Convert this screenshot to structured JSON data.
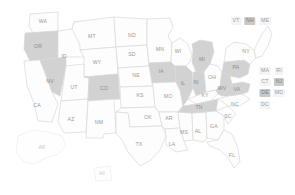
{
  "map": {
    "title": "United States choropleth state map",
    "colors": {
      "selected_fill": "#d2d2d2",
      "unselected_fill": "#fdfdfd",
      "border": "#d8d8d8",
      "label": "#9a9a9a",
      "badge_background": "#f4f4f4",
      "badge_selected_background": "#c9c9c9",
      "page_background": "#ffffff"
    },
    "selected_states": [
      "OR",
      "NV",
      "CO",
      "IA",
      "IL",
      "IN",
      "MI",
      "PA",
      "WV",
      "VA",
      "TN",
      "NH",
      "NJ",
      "DE"
    ],
    "states": [
      {
        "code": "WA",
        "label": "WA",
        "selected": false,
        "lx": 43,
        "ly": 22
      },
      {
        "code": "OR",
        "label": "OR",
        "selected": true,
        "lx": 38,
        "ly": 47
      },
      {
        "code": "CA",
        "label": "CA",
        "selected": false,
        "lx": 37,
        "ly": 106
      },
      {
        "code": "NV",
        "label": "NV",
        "selected": true,
        "lx": 50,
        "ly": 82
      },
      {
        "code": "ID",
        "label": "ID",
        "selected": false,
        "lx": 64,
        "ly": 57
      },
      {
        "code": "MT",
        "label": "MT",
        "selected": false,
        "lx": 92,
        "ly": 37
      },
      {
        "code": "WY",
        "label": "WY",
        "selected": false,
        "lx": 97,
        "ly": 63
      },
      {
        "code": "UT",
        "label": "UT",
        "selected": false,
        "lx": 74,
        "ly": 88
      },
      {
        "code": "AZ",
        "label": "AZ",
        "selected": false,
        "lx": 71,
        "ly": 120
      },
      {
        "code": "CO",
        "label": "CO",
        "selected": true,
        "lx": 104,
        "ly": 89
      },
      {
        "code": "NM",
        "label": "NM",
        "selected": false,
        "lx": 99,
        "ly": 123
      },
      {
        "code": "ND",
        "label": "ND",
        "selected": false,
        "lx": 132,
        "ly": 36
      },
      {
        "code": "SD",
        "label": "SD",
        "selected": false,
        "lx": 132,
        "ly": 55
      },
      {
        "code": "NE",
        "label": "NE",
        "selected": false,
        "lx": 136,
        "ly": 76
      },
      {
        "code": "KS",
        "label": "KS",
        "selected": false,
        "lx": 140,
        "ly": 96
      },
      {
        "code": "OK",
        "label": "OK",
        "selected": false,
        "lx": 148,
        "ly": 118
      },
      {
        "code": "TX",
        "label": "TX",
        "selected": false,
        "lx": 139,
        "ly": 145
      },
      {
        "code": "MN",
        "label": "MN",
        "selected": false,
        "lx": 160,
        "ly": 50
      },
      {
        "code": "IA",
        "label": "IA",
        "selected": true,
        "lx": 161,
        "ly": 72
      },
      {
        "code": "MO",
        "label": "MO",
        "selected": false,
        "lx": 168,
        "ly": 97
      },
      {
        "code": "AR",
        "label": "AR",
        "selected": false,
        "lx": 169,
        "ly": 119
      },
      {
        "code": "LA",
        "label": "LA",
        "selected": false,
        "lx": 172,
        "ly": 145
      },
      {
        "code": "WI",
        "label": "WI",
        "selected": false,
        "lx": 178,
        "ly": 52
      },
      {
        "code": "IL",
        "label": "IL",
        "selected": true,
        "lx": 183,
        "ly": 84
      },
      {
        "code": "MS",
        "label": "MS",
        "selected": false,
        "lx": 184,
        "ly": 133
      },
      {
        "code": "MI",
        "label": "MI",
        "selected": true,
        "lx": 202,
        "ly": 60
      },
      {
        "code": "IN",
        "label": "IN",
        "selected": true,
        "lx": 196,
        "ly": 83
      },
      {
        "code": "AL",
        "label": "AL",
        "selected": false,
        "lx": 198,
        "ly": 132
      },
      {
        "code": "KY",
        "label": "KY",
        "selected": false,
        "lx": 205,
        "ly": 96
      },
      {
        "code": "TN",
        "label": "TN",
        "selected": true,
        "lx": 199,
        "ly": 108
      },
      {
        "code": "OH",
        "label": "OH",
        "selected": false,
        "lx": 212,
        "ly": 78
      },
      {
        "code": "GA",
        "label": "GA",
        "selected": false,
        "lx": 214,
        "ly": 127
      },
      {
        "code": "FL",
        "label": "FL",
        "selected": false,
        "lx": 232,
        "ly": 156
      },
      {
        "code": "SC",
        "label": "SC",
        "selected": false,
        "lx": 228,
        "ly": 117
      },
      {
        "code": "NC",
        "label": "NC",
        "selected": false,
        "lx": 235,
        "ly": 105
      },
      {
        "code": "WV",
        "label": "WV",
        "selected": true,
        "lx": 222,
        "ly": 89
      },
      {
        "code": "VA",
        "label": "VA",
        "selected": true,
        "lx": 237,
        "ly": 90
      },
      {
        "code": "PA",
        "label": "PA",
        "selected": true,
        "lx": 236,
        "ly": 68
      },
      {
        "code": "NY",
        "label": "NY",
        "selected": false,
        "lx": 246,
        "ly": 52
      },
      {
        "code": "AK",
        "label": "AK",
        "selected": false,
        "lx": 42,
        "ly": 148
      },
      {
        "code": "HI",
        "label": "HI",
        "selected": false,
        "lx": 102,
        "ly": 174
      }
    ],
    "badges": [
      {
        "code": "VT",
        "label": "VT",
        "selected": false,
        "lx": 236,
        "ly": 21
      },
      {
        "code": "NH",
        "label": "NH",
        "selected": true,
        "lx": 250,
        "ly": 21
      },
      {
        "code": "ME",
        "label": "ME",
        "selected": false,
        "lx": 265,
        "ly": 21
      },
      {
        "code": "MA",
        "label": "MA",
        "selected": false,
        "lx": 265,
        "ly": 71
      },
      {
        "code": "RI",
        "label": "RI",
        "selected": false,
        "lx": 279,
        "ly": 71
      },
      {
        "code": "CT",
        "label": "CT",
        "selected": false,
        "lx": 265,
        "ly": 82
      },
      {
        "code": "NJ",
        "label": "NJ",
        "selected": true,
        "lx": 279,
        "ly": 82
      },
      {
        "code": "DE",
        "label": "DE",
        "selected": true,
        "lx": 265,
        "ly": 93
      },
      {
        "code": "MD",
        "label": "MD",
        "selected": false,
        "lx": 279,
        "ly": 93
      },
      {
        "code": "DC",
        "label": "DC",
        "selected": false,
        "lx": 265,
        "ly": 105
      }
    ]
  }
}
